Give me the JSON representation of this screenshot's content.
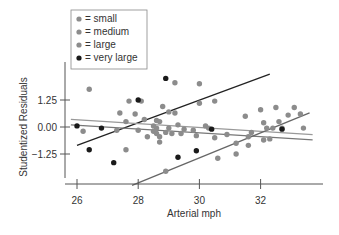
{
  "chart_data": {
    "type": "scatter",
    "title": "",
    "xlabel": "Arterial mph",
    "ylabel": "Studentized Residuals",
    "xlim": [
      25.6,
      33.8
    ],
    "ylim": [
      -2.7,
      2.9
    ],
    "x_ticks": [
      26,
      28,
      30,
      32
    ],
    "x_tick_labels": [
      "26",
      "28",
      "30",
      "32"
    ],
    "y_ticks": [
      1.25,
      0.0,
      -1.25
    ],
    "y_tick_labels": [
      "1.25",
      "0.00",
      "−1.25"
    ],
    "grid": false,
    "legend_position": "top-left",
    "legend": [
      {
        "label": "= small",
        "color": "#8c8c8c"
      },
      {
        "label": "= medium",
        "color": "#8c8c8c"
      },
      {
        "label": "= large",
        "color": "#8c8c8c"
      },
      {
        "label": "= very large",
        "color": "#1a1a1a"
      }
    ],
    "series": [
      {
        "name": "small/medium/large",
        "color": "#8c8c8c",
        "points": [
          [
            26.4,
            1.75
          ],
          [
            27.4,
            0.65
          ],
          [
            27.6,
            0.25
          ],
          [
            27.9,
            0.6
          ],
          [
            28.1,
            1.2
          ],
          [
            28.0,
            -0.15
          ],
          [
            27.3,
            -0.15
          ],
          [
            28.6,
            0.3
          ],
          [
            28.2,
            0.35
          ],
          [
            28.7,
            -0.7
          ],
          [
            27.6,
            -1.05
          ],
          [
            28.3,
            -0.45
          ],
          [
            28.8,
            0.95
          ],
          [
            29.2,
            2.05
          ],
          [
            28.7,
            0.25
          ],
          [
            29.2,
            0.65
          ],
          [
            29.3,
            0.1
          ],
          [
            29.5,
            -0.1
          ],
          [
            29.8,
            -0.15
          ],
          [
            30.2,
            0.05
          ],
          [
            30.0,
            1.1
          ],
          [
            30.5,
            1.2
          ],
          [
            28.5,
            0.05
          ],
          [
            28.6,
            -0.05
          ],
          [
            28.9,
            -0.25
          ],
          [
            29.1,
            -0.3
          ],
          [
            28.7,
            -0.45
          ],
          [
            28.5,
            -0.2
          ],
          [
            28.6,
            -0.3
          ],
          [
            29.0,
            -0.05
          ],
          [
            29.4,
            -0.3
          ],
          [
            29.9,
            -0.4
          ],
          [
            30.5,
            -0.5
          ],
          [
            31.2,
            -0.75
          ],
          [
            31.6,
            -0.85
          ],
          [
            31.2,
            -1.25
          ],
          [
            30.6,
            -1.45
          ],
          [
            30.3,
            -0.05
          ],
          [
            30.9,
            -0.35
          ],
          [
            31.6,
            -0.45
          ],
          [
            31.7,
            -0.25
          ],
          [
            32.0,
            0.8
          ],
          [
            32.5,
            0.9
          ],
          [
            32.1,
            0.2
          ],
          [
            32.6,
            0.25
          ],
          [
            32.2,
            -0.05
          ],
          [
            32.4,
            -0.05
          ],
          [
            32.9,
            0.55
          ],
          [
            33.3,
            0.6
          ],
          [
            33.1,
            0.9
          ],
          [
            31.5,
            0.5
          ],
          [
            32.3,
            -0.55
          ],
          [
            32.1,
            -0.6
          ],
          [
            32.7,
            -0.05
          ],
          [
            33.4,
            -0.05
          ],
          [
            28.9,
            -2.05
          ],
          [
            30.0,
            2.0
          ],
          [
            29.0,
            0.7
          ],
          [
            27.7,
            1.2
          ],
          [
            26.2,
            -0.2
          ]
        ]
      },
      {
        "name": "very large",
        "color": "#1a1a1a",
        "points": [
          [
            26.0,
            0.05
          ],
          [
            26.4,
            -1.05
          ],
          [
            26.8,
            -0.05
          ],
          [
            27.2,
            -1.65
          ],
          [
            28.0,
            1.25
          ],
          [
            28.9,
            2.25
          ],
          [
            29.3,
            -1.4
          ],
          [
            29.9,
            -1.1
          ],
          [
            30.4,
            -0.1
          ],
          [
            32.7,
            -0.1
          ]
        ]
      }
    ],
    "lines": [
      {
        "name": "very large fit",
        "color": "#222222",
        "from": [
          26.0,
          -0.85
        ],
        "to": [
          32.3,
          2.45
        ]
      },
      {
        "name": "small fit",
        "color": "#999999",
        "from": [
          25.8,
          0.35
        ],
        "to": [
          33.7,
          -0.35
        ]
      },
      {
        "name": "medium fit",
        "color": "#777777",
        "from": [
          25.8,
          0.1
        ],
        "to": [
          33.7,
          -0.6
        ]
      },
      {
        "name": "large fit",
        "color": "#666666",
        "from": [
          27.8,
          -2.7
        ],
        "to": [
          33.6,
          0.65
        ]
      }
    ]
  }
}
